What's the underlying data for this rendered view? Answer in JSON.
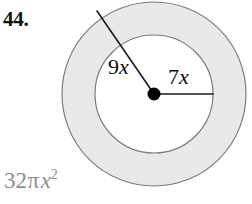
{
  "problem": {
    "number_label": "44.",
    "answer_label": {
      "coefficient": "32",
      "pi_symbol": "π",
      "variable": "x",
      "exponent": "2",
      "full": "32πx²"
    }
  },
  "figure": {
    "type": "annulus",
    "center": {
      "x": 154,
      "y": 94
    },
    "inner_radius_px": 59,
    "outer_radius_px": 92,
    "inner_radius_label": {
      "digit": "9",
      "variable": "x",
      "full": "9x"
    },
    "outer_radius_label": {
      "digit": "7",
      "variable": "x",
      "full": "7x"
    },
    "colors": {
      "ring_fill": "#e9e9e9",
      "inner_fill": "#ffffff",
      "stroke": "#7c7c7c",
      "radius_line": "#1a1a1a",
      "center_dot": "#000000",
      "answer_text": "#8e8e8e",
      "number_text": "#111111"
    },
    "radius_lines": [
      {
        "name": "nine-x-radius",
        "from": {
          "x": 97,
          "y": 11
        },
        "to": {
          "x": 154,
          "y": 94
        },
        "label": "9x",
        "endpoint": "outer-circle"
      },
      {
        "name": "seven-x-radius",
        "from": {
          "x": 154,
          "y": 94
        },
        "to": {
          "x": 213,
          "y": 94
        },
        "label": "7x",
        "endpoint": "inner-circle"
      }
    ]
  }
}
